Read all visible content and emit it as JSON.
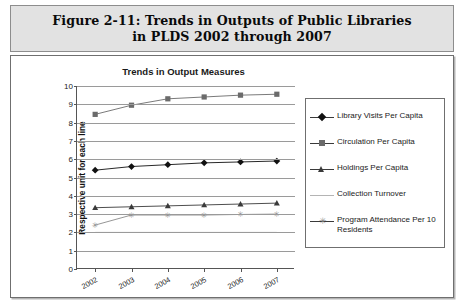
{
  "figure": {
    "title_line1": "Figure 2-11:  Trends in Outputs of Public Libraries",
    "title_line2": "in PLDS 2002 through 2007"
  },
  "chart_data": {
    "type": "line",
    "title": "Trends in Output Measures",
    "xlabel": "",
    "ylabel": "Respective unit for each line",
    "categories": [
      "2002",
      "2003",
      "2004",
      "2005",
      "2006",
      "2007"
    ],
    "ylim": [
      0,
      10
    ],
    "yticks": [
      0,
      1,
      2,
      3,
      4,
      5,
      6,
      7,
      8,
      9,
      10
    ],
    "grid": true,
    "legend_position": "right",
    "series": [
      {
        "name": "Library Visits Per Capita",
        "marker": "diamond",
        "color": "#111111",
        "values": [
          5.4,
          5.6,
          5.7,
          5.8,
          5.85,
          5.9
        ]
      },
      {
        "name": "Circulation Per Capita",
        "marker": "square",
        "color": "#6b6b6b",
        "values": [
          8.45,
          8.95,
          9.3,
          9.4,
          9.5,
          9.55
        ]
      },
      {
        "name": "Holdings Per Capita",
        "marker": "triangle",
        "color": "#3a3a3a",
        "values": [
          3.35,
          3.4,
          3.45,
          3.5,
          3.55,
          3.6
        ]
      },
      {
        "name": "Collection Turnover",
        "marker": "none",
        "color": "#b4b4b4",
        "values": [
          2.0,
          2.0,
          2.0,
          2.0,
          2.0,
          2.0
        ]
      },
      {
        "name": "Program Attendance Per 10 Residents",
        "marker": "star",
        "color": "#8a8a8a",
        "values": [
          2.4,
          2.95,
          2.95,
          2.95,
          2.98,
          3.0
        ]
      }
    ]
  }
}
